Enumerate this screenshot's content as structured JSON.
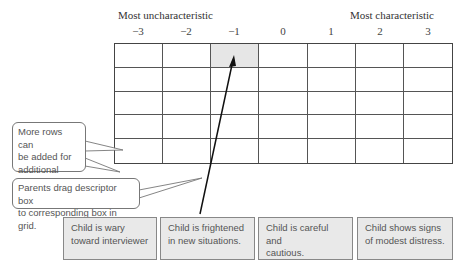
{
  "axis": {
    "left_label": "Most uncharacteristic",
    "right_label": "Most characteristic",
    "columns": [
      "−3",
      "−2",
      "−1",
      "0",
      "1",
      "2",
      "3"
    ]
  },
  "grid": {
    "rows": 5,
    "columns": 7,
    "highlighted_cell": {
      "row": 0,
      "column": "−1"
    }
  },
  "callouts": [
    {
      "text_lines": [
        "More rows can",
        "be added for",
        "additional items",
        "to be ranked."
      ]
    },
    {
      "text_lines": [
        "Parents drag descriptor box",
        "to corresponding box in grid."
      ]
    }
  ],
  "descriptors": [
    {
      "text_lines": [
        "Child is wary",
        "toward interviewer"
      ]
    },
    {
      "text_lines": [
        "Child is frightened",
        "in new situations."
      ]
    },
    {
      "text_lines": [
        "Child is careful and",
        "cautious."
      ]
    },
    {
      "text_lines": [
        "Child shows signs",
        "of modest distress."
      ]
    }
  ],
  "colors": {
    "highlight_cell": "#e6e6e6",
    "descriptor_fill": "#e9e9e9",
    "arrow": "#111111"
  }
}
